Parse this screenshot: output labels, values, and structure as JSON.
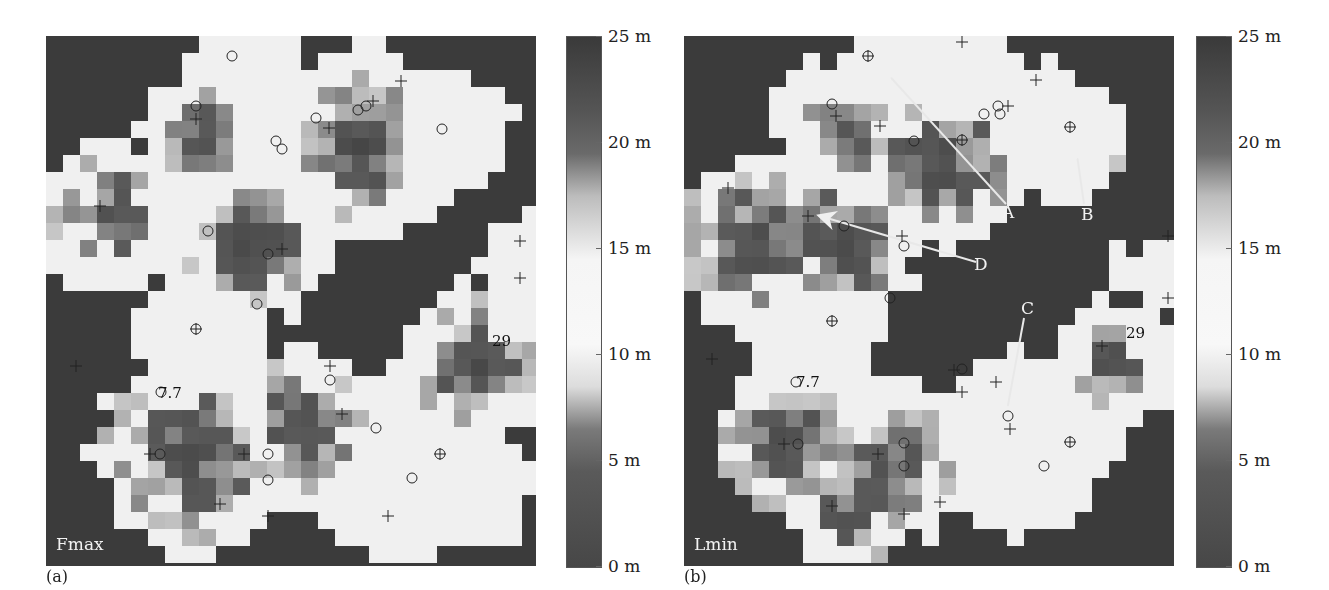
{
  "chart_data": [
    {
      "type": "heatmap",
      "panel": "(a)",
      "map_label": "Fmax",
      "colorbar": {
        "ticks": [
          "25 m",
          "20 m",
          "15 m",
          "10 m",
          "5 m",
          "0 m"
        ],
        "range": [
          0,
          25
        ],
        "unit": "m"
      },
      "annotations": [
        {
          "text": "7.7",
          "x": 0.26,
          "y": 0.67
        },
        {
          "text": "29",
          "x": 0.93,
          "y": 0.57
        }
      ],
      "markers": "plus and circle symbols marking tree positions"
    },
    {
      "type": "heatmap",
      "panel": "(b)",
      "map_label": "Lmin",
      "colorbar": {
        "ticks": [
          "25 m",
          "20 m",
          "15 m",
          "10 m",
          "5 m",
          "0 m"
        ],
        "range": [
          0,
          25
        ],
        "unit": "m"
      },
      "annotations": [
        {
          "text": "7.7",
          "x": 0.24,
          "y": 0.65
        },
        {
          "text": "29",
          "x": 0.92,
          "y": 0.56
        }
      ],
      "arrows": [
        {
          "label": "A",
          "label_pos": [
            0.67,
            0.33
          ],
          "tip": [
            0.41,
            0.07
          ]
        },
        {
          "label": "B",
          "label_pos": [
            0.82,
            0.33
          ],
          "tip": [
            0.8,
            0.21
          ]
        },
        {
          "label": "C",
          "label_pos": [
            0.69,
            0.52
          ],
          "tip": [
            0.65,
            0.73
          ]
        },
        {
          "label": "D",
          "label_pos": [
            0.61,
            0.42
          ],
          "tip": [
            0.27,
            0.32
          ]
        }
      ]
    }
  ],
  "figure": {
    "panel_a": {
      "sublabel": "(a)",
      "map_label": "Fmax",
      "note1": "7.7",
      "note2": "29"
    },
    "panel_b": {
      "sublabel": "(b)",
      "map_label": "Lmin",
      "note1": "7.7",
      "note2": "29",
      "arrow_labels": [
        "A",
        "B",
        "C",
        "D"
      ]
    },
    "colorbar_ticks": [
      "25 m",
      "20 m",
      "15 m",
      "10 m",
      "5 m",
      "0 m"
    ]
  }
}
